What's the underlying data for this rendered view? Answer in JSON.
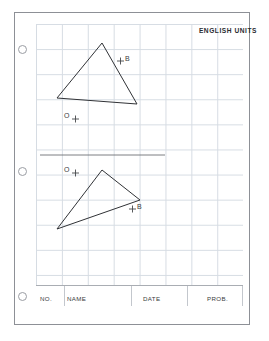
{
  "sheet": {
    "units_label": "ENGLISH UNITS",
    "punch_holes": 3
  },
  "grid": {
    "columns": 8,
    "rows": 10,
    "cell_size_px": 25
  },
  "upper_figure": {
    "triangle": {
      "apex": [
        102,
        43
      ],
      "left": [
        57,
        98
      ],
      "right": [
        137,
        104
      ]
    },
    "label_b": "B",
    "label_o": "O"
  },
  "divider": {
    "x1": 40,
    "y1": 155,
    "x2": 165,
    "y2": 155
  },
  "lower_figure": {
    "triangle": {
      "apex": [
        102,
        170
      ],
      "right": [
        140,
        200
      ],
      "bottom_left": [
        57,
        229
      ]
    },
    "label_b": "B",
    "label_o": "O"
  },
  "title_block": {
    "fields": [
      {
        "label": "NO.",
        "left": 3,
        "width": 26
      },
      {
        "label": "NAME",
        "left": 29,
        "width": 67
      },
      {
        "label": "DATE",
        "left": 96,
        "width": 56
      },
      {
        "label": "PROB.",
        "left": 152,
        "width": 55
      }
    ]
  }
}
